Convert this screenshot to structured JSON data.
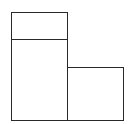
{
  "diagram": {
    "type": "block-layout",
    "stroke_color": "#2a2a2a",
    "background": "#ffffff",
    "boxes": [
      {
        "id": "top-left-header",
        "x": 11,
        "y": 12,
        "w": 57,
        "h": 28,
        "label": ""
      },
      {
        "id": "left-tall",
        "x": 11,
        "y": 39,
        "w": 57,
        "h": 82,
        "label": ""
      },
      {
        "id": "right-lower",
        "x": 67,
        "y": 67,
        "w": 57,
        "h": 54,
        "label": ""
      }
    ]
  }
}
